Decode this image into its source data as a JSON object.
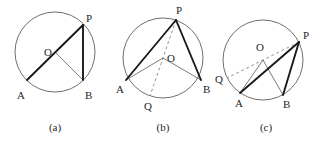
{
  "figure": {
    "background_color": "#ffffff",
    "width": 328,
    "height": 142,
    "colors": {
      "circle_stroke": "#6f6f6f",
      "chord_stroke": "#1a1a1a",
      "radius_stroke": "#6b6b6b",
      "dashed_stroke": "#8a8a8a",
      "label_color": "#262626"
    }
  },
  "panels": [
    {
      "id": "a",
      "caption": "(a)",
      "caption_pos": {
        "x": 55,
        "y": 131
      },
      "circle": {
        "cx": 55,
        "cy": 52,
        "r": 40
      },
      "points": [
        {
          "name": "O",
          "label": "O",
          "x": 55,
          "y": 52,
          "label_x": 44,
          "label_y": 56
        },
        {
          "name": "P",
          "label": "P",
          "x": 83,
          "y": 25,
          "label_x": 86,
          "label_y": 22
        },
        {
          "name": "A",
          "label": "A",
          "x": 27,
          "y": 80,
          "label_x": 17,
          "label_y": 99
        },
        {
          "name": "B",
          "label": "B",
          "x": 83,
          "y": 80,
          "label_x": 85,
          "label_y": 99
        }
      ],
      "thick_segments": [
        {
          "name": "segment-AP",
          "from": "A",
          "to": "P"
        },
        {
          "name": "segment-PB",
          "from": "P",
          "to": "B"
        }
      ],
      "thin_segments": [
        {
          "name": "radius-OB",
          "from": "O",
          "to": "B"
        }
      ],
      "dashed_segments": []
    },
    {
      "id": "b",
      "caption": "(b)",
      "caption_pos": {
        "x": 163,
        "y": 131
      },
      "circle": {
        "cx": 163,
        "cy": 58,
        "r": 40
      },
      "points": [
        {
          "name": "O",
          "label": "O",
          "x": 163,
          "y": 58,
          "label_x": 167,
          "label_y": 62
        },
        {
          "name": "P",
          "label": "P",
          "x": 176,
          "y": 20,
          "label_x": 176,
          "label_y": 14
        },
        {
          "name": "A",
          "label": "A",
          "x": 126,
          "y": 80,
          "label_x": 116,
          "label_y": 93
        },
        {
          "name": "B",
          "label": "B",
          "x": 201,
          "y": 80,
          "label_x": 203,
          "label_y": 93
        },
        {
          "name": "Q",
          "label": "Q",
          "x": 150,
          "y": 96,
          "label_x": 144,
          "label_y": 110
        }
      ],
      "thick_segments": [
        {
          "name": "segment-AP",
          "from": "A",
          "to": "P"
        },
        {
          "name": "segment-PB",
          "from": "P",
          "to": "B"
        }
      ],
      "thin_segments": [
        {
          "name": "radius-OA",
          "from": "O",
          "to": "A"
        },
        {
          "name": "radius-OB",
          "from": "O",
          "to": "B"
        }
      ],
      "dashed_segments": [
        {
          "name": "diameter-PQ",
          "from": "P",
          "to": "Q"
        }
      ]
    },
    {
      "id": "c",
      "caption": "(c)",
      "caption_pos": {
        "x": 266,
        "y": 131
      },
      "circle": {
        "cx": 263,
        "cy": 60,
        "r": 40
      },
      "points": [
        {
          "name": "O",
          "label": "O",
          "x": 263,
          "y": 60,
          "label_x": 256,
          "label_y": 51
        },
        {
          "name": "P",
          "label": "P",
          "x": 299,
          "y": 42,
          "label_x": 303,
          "label_y": 39
        },
        {
          "name": "A",
          "label": "A",
          "x": 240,
          "y": 93,
          "label_x": 235,
          "label_y": 107
        },
        {
          "name": "B",
          "label": "B",
          "x": 283,
          "y": 95,
          "label_x": 283,
          "label_y": 108
        },
        {
          "name": "Q",
          "label": "Q",
          "x": 227,
          "y": 78,
          "label_x": 215,
          "label_y": 83
        }
      ],
      "thick_segments": [
        {
          "name": "segment-AP",
          "from": "A",
          "to": "P"
        },
        {
          "name": "segment-PB",
          "from": "P",
          "to": "B"
        }
      ],
      "thin_segments": [
        {
          "name": "radius-OA",
          "from": "O",
          "to": "A"
        },
        {
          "name": "radius-OB",
          "from": "O",
          "to": "B"
        }
      ],
      "dashed_segments": [
        {
          "name": "diameter-PQ",
          "from": "P",
          "to": "Q"
        }
      ]
    }
  ]
}
